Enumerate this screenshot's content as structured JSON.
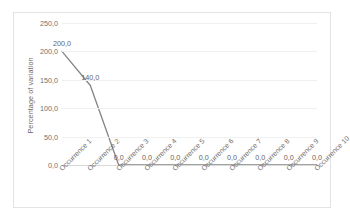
{
  "chart_data": {
    "type": "line",
    "title": "",
    "xlabel": "",
    "ylabel": "Percentage of variation",
    "categories": [
      "Occurrence 1",
      "Occurrence 2",
      "Occurrence 3",
      "Occurrence 4",
      "Occurrence 5",
      "Occurrence 6",
      "Occurrence 7",
      "Occurrence 8",
      "Occurrence 9",
      "Occurrence 10"
    ],
    "values": [
      200.0,
      140.0,
      0.0,
      0.0,
      0.0,
      0.0,
      0.0,
      0.0,
      0.0,
      0.0
    ],
    "data_labels": [
      "200,0",
      "140,0",
      "0,0",
      "0,0",
      "0,0",
      "0,0",
      "0,0",
      "0,0",
      "0,0",
      "0,0"
    ],
    "ylim": [
      0,
      250
    ],
    "ytick_values": [
      250,
      200,
      150,
      100,
      50,
      0
    ],
    "ytick_labels": [
      "250,0",
      "200,0",
      "150,0",
      "100,0",
      "50,0",
      "0,0"
    ],
    "grid": true,
    "legend": false,
    "legend_position": "none",
    "series_color": "#848484",
    "gridline_color": "#f0f0f0",
    "axis_color": "#d9d9d9",
    "border_color": "#e3e3e3",
    "decimal_separator": ","
  }
}
